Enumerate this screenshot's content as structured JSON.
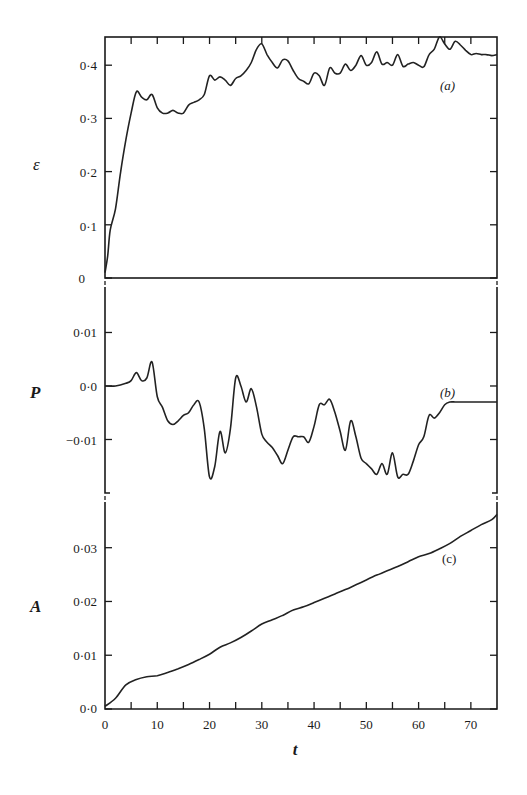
{
  "chart_data": [
    {
      "type": "line",
      "panel": "(a)",
      "ylabel": "ε",
      "xlabel": "",
      "xlim": [
        0,
        75
      ],
      "ylim": [
        0,
        0.453
      ],
      "yticks": [
        0,
        0.1,
        0.2,
        0.3,
        0.4
      ],
      "ytick_labels": [
        "0",
        "0·1",
        "0·2",
        "0·3",
        "0·4"
      ],
      "grid": false,
      "series": [
        {
          "name": "epsilon",
          "x": [
            0,
            0.5,
            1,
            2,
            3,
            4,
            5,
            6,
            7,
            8,
            9,
            10,
            11,
            12,
            13,
            14,
            15,
            16,
            17,
            18,
            19,
            20,
            21,
            22,
            23,
            24,
            25,
            26,
            27,
            28,
            29,
            30,
            31,
            32,
            33,
            34,
            35,
            36,
            37,
            38,
            39,
            40,
            41,
            42,
            43,
            44,
            45,
            46,
            47,
            48,
            49,
            50,
            51,
            52,
            53,
            54,
            55,
            56,
            57,
            58,
            59,
            60,
            61,
            62,
            63,
            64,
            65,
            66,
            67,
            68,
            69,
            70,
            71,
            72,
            73,
            74,
            75
          ],
          "values": [
            0.01,
            0.04,
            0.09,
            0.13,
            0.2,
            0.26,
            0.31,
            0.35,
            0.34,
            0.335,
            0.345,
            0.32,
            0.31,
            0.31,
            0.315,
            0.31,
            0.31,
            0.325,
            0.33,
            0.335,
            0.345,
            0.38,
            0.372,
            0.378,
            0.372,
            0.362,
            0.375,
            0.38,
            0.39,
            0.405,
            0.43,
            0.44,
            0.42,
            0.405,
            0.395,
            0.41,
            0.408,
            0.39,
            0.375,
            0.37,
            0.365,
            0.385,
            0.38,
            0.362,
            0.395,
            0.385,
            0.385,
            0.402,
            0.39,
            0.4,
            0.418,
            0.4,
            0.405,
            0.425,
            0.402,
            0.405,
            0.4,
            0.42,
            0.398,
            0.402,
            0.405,
            0.4,
            0.397,
            0.42,
            0.43,
            0.455,
            0.44,
            0.43,
            0.445,
            0.438,
            0.428,
            0.42,
            0.422,
            0.42,
            0.42,
            0.418,
            0.42
          ]
        }
      ]
    },
    {
      "type": "line",
      "panel": "(b)",
      "ylabel": "P",
      "xlabel": "",
      "xlim": [
        0,
        75
      ],
      "ylim": [
        -0.02,
        0.0185
      ],
      "yticks": [
        0.01,
        0.0,
        -0.01
      ],
      "ytick_labels": [
        "0·01",
        "0·0",
        "−0·01"
      ],
      "grid": false,
      "series": [
        {
          "name": "P",
          "x": [
            0,
            2,
            4,
            5,
            6,
            7,
            8,
            9,
            10,
            11,
            12,
            13,
            14,
            15,
            16,
            17,
            18,
            19,
            20,
            21,
            22,
            23,
            24,
            25,
            26,
            27,
            28,
            29,
            30,
            31,
            32,
            33,
            34,
            35,
            36,
            37,
            38,
            39,
            40,
            41,
            42,
            43,
            44,
            45,
            46,
            47,
            48,
            49,
            50,
            51,
            52,
            53,
            54,
            55,
            56,
            57,
            58,
            59,
            60,
            61,
            62,
            63,
            64,
            65,
            66,
            67,
            68,
            69,
            70,
            71,
            72,
            73,
            74,
            75
          ],
          "values": [
            0.0,
            0.0,
            0.0005,
            0.001,
            0.0025,
            0.001,
            0.0015,
            0.0045,
            -0.002,
            -0.004,
            -0.0065,
            -0.0072,
            -0.0065,
            -0.0055,
            -0.005,
            -0.0035,
            -0.003,
            -0.008,
            -0.017,
            -0.015,
            -0.0085,
            -0.0125,
            -0.008,
            0.0015,
            0.0,
            -0.003,
            -0.0005,
            -0.004,
            -0.009,
            -0.0105,
            -0.0115,
            -0.013,
            -0.0145,
            -0.012,
            -0.0095,
            -0.0095,
            -0.0095,
            -0.0105,
            -0.0075,
            -0.0035,
            -0.0035,
            -0.0025,
            -0.005,
            -0.0085,
            -0.012,
            -0.0065,
            -0.0095,
            -0.0135,
            -0.0145,
            -0.0155,
            -0.0165,
            -0.0145,
            -0.0165,
            -0.0125,
            -0.017,
            -0.0165,
            -0.0165,
            -0.014,
            -0.011,
            -0.0095,
            -0.0055,
            -0.006,
            -0.005,
            -0.0035,
            -0.003,
            -0.003,
            -0.003,
            -0.003,
            -0.003,
            -0.003,
            -0.003,
            -0.003,
            -0.003,
            -0.003
          ]
        }
      ]
    },
    {
      "type": "line",
      "panel": "(c)",
      "ylabel": "A",
      "xlabel": "t",
      "xlim": [
        0,
        75
      ],
      "ylim": [
        0,
        0.0385
      ],
      "xticks": [
        0,
        10,
        20,
        30,
        40,
        50,
        60,
        70
      ],
      "xtick_labels": [
        "0",
        "10",
        "20",
        "30",
        "40",
        "50",
        "60",
        "70"
      ],
      "yticks": [
        0.0,
        0.01,
        0.02,
        0.03
      ],
      "ytick_labels": [
        "0·0",
        "0·01",
        "0·02",
        "0·03"
      ],
      "grid": false,
      "series": [
        {
          "name": "A",
          "x": [
            0,
            2,
            4,
            6,
            8,
            10,
            12,
            14,
            16,
            18,
            20,
            22,
            24,
            26,
            28,
            30,
            32,
            34,
            36,
            38,
            40,
            42,
            44,
            46,
            48,
            50,
            52,
            54,
            56,
            58,
            60,
            62,
            64,
            66,
            68,
            70,
            72,
            74,
            75
          ],
          "values": [
            0.0005,
            0.002,
            0.0045,
            0.0055,
            0.006,
            0.0062,
            0.0068,
            0.0075,
            0.0083,
            0.0092,
            0.0102,
            0.0115,
            0.0123,
            0.0133,
            0.0145,
            0.0158,
            0.0166,
            0.0174,
            0.0184,
            0.019,
            0.0198,
            0.0206,
            0.0214,
            0.0222,
            0.0231,
            0.024,
            0.0249,
            0.0257,
            0.0265,
            0.0274,
            0.0283,
            0.0289,
            0.0298,
            0.0308,
            0.0321,
            0.0332,
            0.0343,
            0.0352,
            0.0362
          ]
        }
      ]
    }
  ],
  "labels": {
    "a": {
      "var": "ε",
      "tag": "(a)",
      "ticks": [
        "0·4",
        "0·3",
        "0·2",
        "0·1",
        "0"
      ]
    },
    "b": {
      "var": "P",
      "tag": "(b)",
      "ticks": [
        "0·01",
        "0·0",
        "−0·01"
      ]
    },
    "c": {
      "var": "A",
      "tag": "(c)",
      "ticks": [
        "0·03",
        "0·02",
        "0·01",
        "0·0"
      ]
    },
    "xticks": [
      "0",
      "10",
      "20",
      "30",
      "40",
      "50",
      "60",
      "70"
    ],
    "xlabel": "t"
  }
}
